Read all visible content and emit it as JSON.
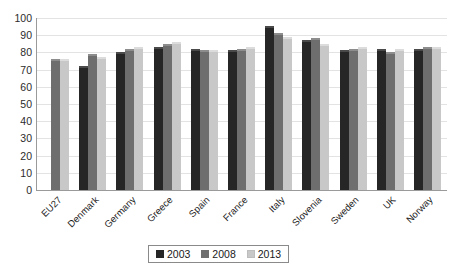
{
  "chart_data": {
    "type": "bar",
    "title": "",
    "xlabel": "",
    "ylabel": "",
    "ylim": [
      0,
      100
    ],
    "ytick_step": 10,
    "grid": true,
    "legend_position": "bottom-center",
    "categories": [
      "EU27",
      "Denmark",
      "Germany",
      "Greece",
      "Spain",
      "France",
      "Italy",
      "Slovenia",
      "Sweden",
      "UK",
      "Norway"
    ],
    "yticks": [
      "100",
      "90",
      "80",
      "70",
      "60",
      "50",
      "40",
      "30",
      "20",
      "10",
      "0"
    ],
    "series": [
      {
        "name": "2003",
        "color": "#262626",
        "values": [
          null,
          71,
          79,
          82,
          81,
          80,
          94,
          86,
          80,
          81,
          81
        ]
      },
      {
        "name": "2008",
        "color": "#6e6e6e",
        "values": [
          75,
          78,
          81,
          84,
          80,
          81,
          90,
          87,
          81,
          79,
          82
        ]
      },
      {
        "name": "2013",
        "color": "#c8c8c8",
        "values": [
          75,
          76,
          82,
          85,
          80,
          82,
          88,
          84,
          82,
          81,
          82
        ]
      }
    ]
  },
  "legend": {
    "items": [
      {
        "label": "2003",
        "swatch_class": "y2003"
      },
      {
        "label": "2008",
        "swatch_class": "y2008"
      },
      {
        "label": "2013",
        "swatch_class": "y2013"
      }
    ]
  },
  "colors": {
    "series_2003": "#262626",
    "series_2008": "#6e6e6e",
    "series_2013": "#c8c8c8",
    "gridline": "#e3e3e3",
    "axis": "#9a9a9a",
    "background": "#ffffff"
  }
}
